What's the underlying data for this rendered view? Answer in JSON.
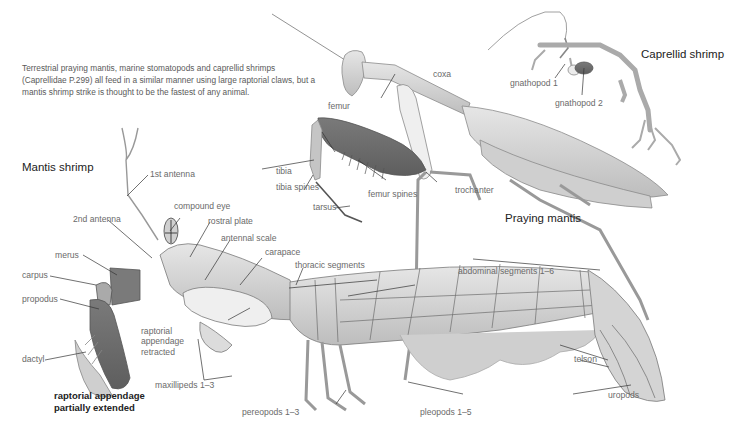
{
  "intro_text": "Terrestrial praying mantis, marine stomatopods and caprellid shrimps (Caprellidae P.299) all feed in a similar manner using large raptorial claws, but a mantis shrimp strike is thought to be the fastest of any animal.",
  "species": {
    "mantis_shrimp": {
      "title": "Mantis shrimp",
      "labels": {
        "first_antenna": "1st antenna",
        "second_antenna": "2nd antenna",
        "compound_eye": "compound eye",
        "rostral_plate": "rostral plate",
        "antennal_scale": "antennal scale",
        "carapace": "carapace",
        "merus": "merus",
        "carpus": "carpus",
        "propodus": "propodus",
        "dactyl": "dactyl",
        "raptorial_retracted_1": "raptorial",
        "raptorial_retracted_2": "appendage",
        "raptorial_retracted_3": "retracted",
        "maxillipeds": "maxillipeds 1–3",
        "thoracic_segments": "thoracic segments",
        "abdominal_segments": "abdominal segments 1–6",
        "pereopods": "pereopods 1–3",
        "pleopods": "pleopods 1–5",
        "telson": "telson",
        "uropods": "uropods"
      },
      "caption_line1": "raptorial appendage",
      "caption_line2": "partially extended"
    },
    "praying_mantis": {
      "title": "Praying mantis",
      "labels": {
        "coxa": "coxa",
        "femur": "femur",
        "tibia": "tibia",
        "tibia_spines": "tibia spines",
        "tarsus": "tarsus",
        "femur_spines": "femur spines",
        "trochanter": "trochanter"
      }
    },
    "caprellid_shrimp": {
      "title": "Caprellid shrimp",
      "labels": {
        "gnathopod1": "gnathopod 1",
        "gnathopod2": "gnathopod 2"
      }
    }
  },
  "colors": {
    "body_fill": "#d9d9d9",
    "body_stroke": "#8a8a8a",
    "highlight_fill": "#6e6e6e",
    "leader_line": "#333333",
    "label_text": "#6a6a6a"
  }
}
